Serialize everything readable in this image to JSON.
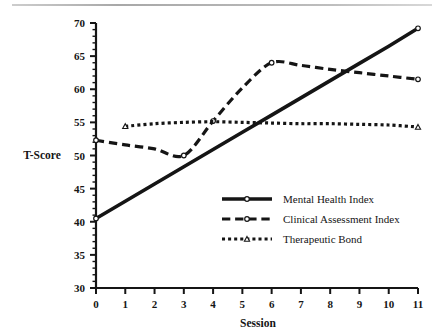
{
  "figure": {
    "background_color": "#ffffff",
    "ink_color": "#151515",
    "top_rule": "horizontal-rule"
  },
  "chart_data": {
    "type": "line",
    "title": "",
    "subtitle": "",
    "xlabel": "Session",
    "ylabel": "T-Score",
    "xlim": [
      0,
      11
    ],
    "ylim": [
      30,
      70
    ],
    "xticks": [
      0,
      1,
      2,
      3,
      4,
      5,
      6,
      7,
      8,
      9,
      10,
      11
    ],
    "xtick_labels": [
      "0",
      "1",
      "2",
      "3",
      "4",
      "5",
      "6",
      "7",
      "8",
      "9",
      "10",
      "11"
    ],
    "yticks": [
      30,
      35,
      40,
      45,
      50,
      55,
      60,
      65,
      70
    ],
    "ytick_labels": [
      "30",
      "35",
      "40",
      "45",
      "50",
      "55",
      "60",
      "65",
      "70"
    ],
    "y_minor_tick_step": 1,
    "grid": false,
    "legend_position": "center-right-inside",
    "series": [
      {
        "name": "Mental Health Index",
        "line_style": "solid",
        "line_width": 3.6,
        "color": "#151515",
        "marker": "circle-open",
        "x": [
          0,
          1,
          2,
          3,
          4,
          5,
          6,
          7,
          8,
          9,
          10,
          11
        ],
        "values": [
          40.5,
          43.1,
          45.7,
          48.3,
          50.9,
          53.5,
          56.1,
          58.7,
          61.3,
          63.9,
          66.5,
          69.2
        ]
      },
      {
        "name": "Clinical Assessment Index",
        "line_style": "dashed",
        "line_width": 3.2,
        "color": "#151515",
        "marker": "circle-open",
        "x": [
          0,
          1,
          2,
          3,
          4,
          5,
          6,
          7,
          8,
          9,
          10,
          11
        ],
        "values": [
          52.3,
          51.6,
          51.0,
          50.0,
          55.2,
          60.2,
          64.0,
          63.6,
          63.0,
          62.5,
          62.0,
          61.5
        ]
      },
      {
        "name": "Therapeutic Bond",
        "line_style": "dotted",
        "line_width": 3.2,
        "color": "#151515",
        "marker": "triangle-open",
        "x": [
          1,
          2,
          3,
          4,
          5,
          6,
          7,
          8,
          9,
          10,
          11
        ],
        "values": [
          54.4,
          54.8,
          55.0,
          55.1,
          55.0,
          54.9,
          54.8,
          54.8,
          54.7,
          54.6,
          54.3
        ]
      }
    ],
    "legend": [
      {
        "label": "Mental Health Index",
        "line_style": "solid"
      },
      {
        "label": "Clinical Assessment Index",
        "line_style": "dashed"
      },
      {
        "label": "Therapeutic Bond",
        "line_style": "dotted"
      }
    ]
  }
}
